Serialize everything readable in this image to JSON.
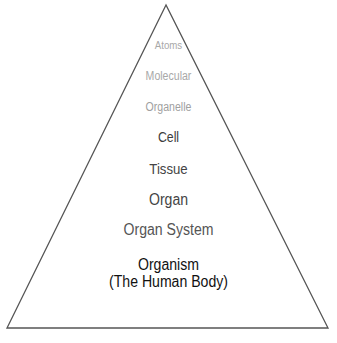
{
  "diagram": {
    "type": "pyramid",
    "levels": [
      {
        "label": "Atoms"
      },
      {
        "label": "Molecular"
      },
      {
        "label": "Organelle"
      },
      {
        "label": "Cell"
      },
      {
        "label": "Tissue"
      },
      {
        "label": "Organ"
      },
      {
        "label": "Organ System"
      },
      {
        "label": "Organism",
        "sublabel": "(The Human Body)"
      }
    ],
    "colors": {
      "outline": "#555555",
      "faded_text": "#a8a8a8",
      "mid_text": "#444444",
      "bold_text": "#111111"
    }
  }
}
